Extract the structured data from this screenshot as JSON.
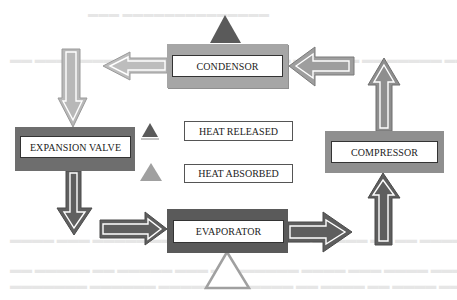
{
  "diagram": {
    "components": {
      "condensor": {
        "label": "CONDENSOR",
        "color": "#a6a6a6"
      },
      "expansion_valve": {
        "label": "EXPANSION VALVE",
        "color": "#6e6e6e"
      },
      "evaporator": {
        "label": "EVAPORATOR",
        "color": "#5a5a5a"
      },
      "compressor": {
        "label": "COMPRESSOR",
        "color": "#8f8f8f"
      }
    },
    "legend": {
      "released": {
        "label": "HEAT RELEASED",
        "icon": "dark-triangle-icon",
        "color": "#5a5a5a"
      },
      "absorbed": {
        "label": "HEAT ABSORBED",
        "icon": "light-triangle-icon",
        "color": "#a0a0a0"
      }
    },
    "flow": [
      "COMPRESSOR -> CONDENSOR",
      "CONDENSOR -> EXPANSION VALVE",
      "EXPANSION VALVE -> EVAPORATOR",
      "EVAPORATOR -> COMPRESSOR"
    ],
    "colors": {
      "arrow_light": "#b5b5b5",
      "arrow_mid": "#8a8a8a",
      "arrow_dark": "#5c5c5c",
      "triangle_released": "#5a5a5a",
      "triangle_absorbed_outline": "#a0a0a0"
    }
  }
}
